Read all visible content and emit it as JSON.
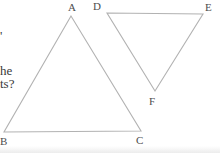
{
  "page": {
    "background_color": "#ffffff",
    "width": 220,
    "height": 153
  },
  "cutoff_text": {
    "color": "#3a3a3a",
    "fragments": [
      {
        "text": "'",
        "x": 0,
        "y": 29
      },
      {
        "text": "he",
        "x": 0,
        "y": 64
      },
      {
        "text": "ts?",
        "x": 0,
        "y": 77
      }
    ]
  },
  "diagram": {
    "stroke_color": "#b2b2b2",
    "stroke_width": 1.1,
    "label_color": "#4d4d4d",
    "triangles": [
      {
        "name": "ABC",
        "vertices": [
          [
            71,
            16
          ],
          [
            4,
            132
          ],
          [
            141,
            131
          ]
        ],
        "labels": [
          {
            "text": "A",
            "x": 68,
            "y": 1
          },
          {
            "text": "B",
            "x": 0,
            "y": 135
          },
          {
            "text": "C",
            "x": 136,
            "y": 134
          }
        ]
      },
      {
        "name": "DEF",
        "vertices": [
          [
            107,
            13
          ],
          [
            203,
            14
          ],
          [
            155,
            91
          ]
        ],
        "labels": [
          {
            "text": "D",
            "x": 93,
            "y": 0
          },
          {
            "text": "E",
            "x": 205,
            "y": 1
          },
          {
            "text": "F",
            "x": 149,
            "y": 95
          }
        ]
      }
    ]
  }
}
